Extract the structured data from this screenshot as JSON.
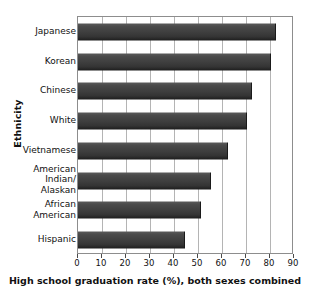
{
  "chart_data": {
    "type": "bar",
    "orientation": "horizontal",
    "title": "",
    "xlabel": "High school graduation rate (%), both sexes combined",
    "ylabel": "Ethnicity",
    "categories": [
      "Japanese",
      "Korean",
      "Chinese",
      "White",
      "Vietnamese",
      "American\nIndian/\nAlaskan",
      "African\nAmerican",
      "Hispanic"
    ],
    "values": [
      82,
      80,
      72,
      70,
      62,
      55,
      51,
      44
    ],
    "xlim": [
      0,
      90
    ],
    "xticks": [
      0,
      10,
      20,
      30,
      40,
      50,
      60,
      70,
      80,
      90
    ],
    "xticklabels": [
      "0",
      "10",
      "20",
      "30",
      "40",
      "50",
      "60",
      "70",
      "80",
      "90"
    ],
    "grid": "vertical",
    "legend": "none",
    "bar_color": "#3d3d3d",
    "grid_color": "#b4b4b4",
    "axis_color": "#8d8d8d"
  }
}
